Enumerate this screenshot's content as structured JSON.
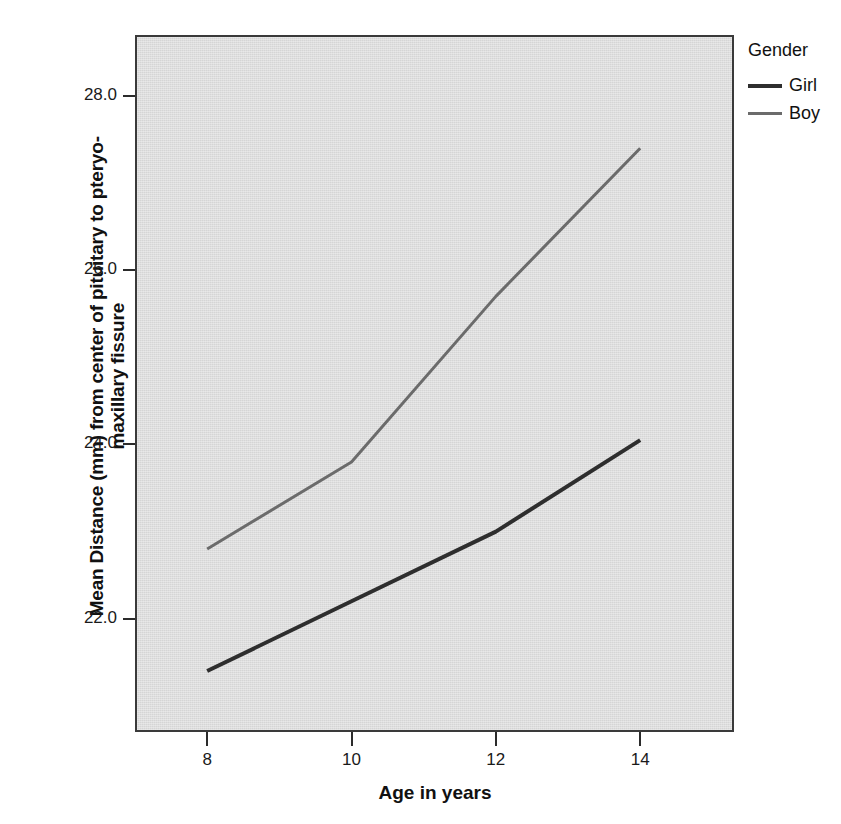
{
  "chart_data": {
    "type": "line",
    "title": "",
    "xlabel": "Age in years",
    "ylabel": "Mean Distance (mm) from center of pituitary to pteryo-maxillary fissure",
    "x": [
      8,
      10,
      12,
      14
    ],
    "xtick_labels": [
      "8",
      "10",
      "12",
      "14"
    ],
    "ytick_labels": [
      "22.0",
      "24.0",
      "26.0",
      "28.0"
    ],
    "ytick_values": [
      22.0,
      24.0,
      26.0,
      28.0
    ],
    "xlim": [
      7.0,
      15.3
    ],
    "ylim": [
      20.7,
      28.7
    ],
    "grid": false,
    "legend_position": "right",
    "legend_title": "Gender",
    "series": [
      {
        "name": "Girl",
        "color": "#2e2e2e",
        "width": 4,
        "values": [
          21.4,
          22.2,
          23.0,
          24.05
        ]
      },
      {
        "name": "Boy",
        "color": "#6b6b6b",
        "width": 3,
        "values": [
          22.8,
          23.8,
          25.7,
          27.4
        ]
      }
    ]
  },
  "axes": {
    "y_title_line1": "Mean Distance (mm) from center of pituitary to pteryo-",
    "y_title_line2": "maxillary fissure",
    "x_title": "Age in years"
  },
  "legend": {
    "title": "Gender",
    "items": [
      {
        "label": "Girl"
      },
      {
        "label": "Boy"
      }
    ]
  },
  "colors": {
    "plot_background": "#d5d5d5",
    "frame": "#3a3a3a",
    "girl_line": "#2e2e2e",
    "boy_line": "#6b6b6b",
    "text": "#111111"
  }
}
